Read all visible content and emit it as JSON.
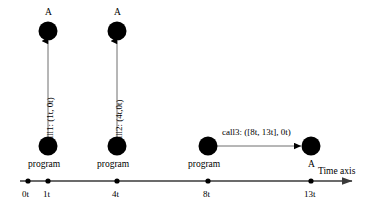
{
  "diagram": {
    "background_color": "#ffffff",
    "ink_color": "#000000",
    "line_color": "#555555",
    "axis": {
      "label": "Time axis",
      "ticks": [
        {
          "label": "0t",
          "value": 0
        },
        {
          "label": "1t",
          "value": 1
        },
        {
          "label": "4t",
          "value": 4
        },
        {
          "label": "8t",
          "value": 8
        },
        {
          "label": "13t",
          "value": 13
        }
      ]
    },
    "groups": [
      {
        "program_label": "program",
        "target_label": "A",
        "call_label": "call1: (1t, 0t)",
        "orientation": "vertical",
        "time": "1t"
      },
      {
        "program_label": "program",
        "target_label": "A",
        "call_label": "call2: (4t,0t)",
        "orientation": "vertical",
        "time": "4t"
      },
      {
        "program_label": "program",
        "target_label": "A",
        "call_label": "call3: ([8t, 13t], 0t)",
        "orientation": "horizontal",
        "time": "8t"
      }
    ]
  }
}
